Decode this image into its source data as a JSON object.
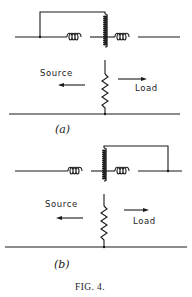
{
  "figure": {
    "caption": "FIG. 4.",
    "ink_color": "#1a1a1a",
    "background": "#ffffff"
  },
  "panels": [
    {
      "id": "a",
      "label": "(a)",
      "source_label": "Source",
      "load_label": "Load",
      "bracket_side": "left",
      "components": [
        "series-inductor-left",
        "tapped-shunt-inductor",
        "series-inductor-right",
        "shunt-resistor"
      ]
    },
    {
      "id": "b",
      "label": "(b)",
      "source_label": "Source",
      "load_label": "Load",
      "bracket_side": "right",
      "components": [
        "series-inductor-left",
        "tapped-shunt-inductor",
        "series-inductor-right",
        "shunt-resistor"
      ]
    }
  ]
}
